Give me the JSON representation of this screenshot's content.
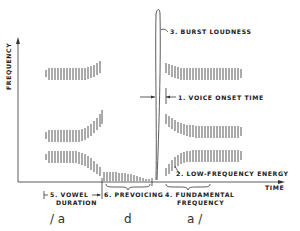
{
  "diagram": {
    "axes": {
      "y_label": "FREQUENCY",
      "x_label": "TIME"
    },
    "annotations": [
      {
        "id": "burst",
        "label": "3. BURST LOUDNESS"
      },
      {
        "id": "vot",
        "label": "1. VOICE ONSET TIME"
      },
      {
        "id": "lfe",
        "label": "2. LOW-FREQUENCY ENERGY"
      },
      {
        "id": "vowel_dur_1",
        "label": "5. VOWEL"
      },
      {
        "id": "vowel_dur_2",
        "label": "DURATION"
      },
      {
        "id": "prevoicing",
        "label": "6. PREVOICING"
      },
      {
        "id": "f0_1",
        "label": "4. FUNDAMENTAL"
      },
      {
        "id": "f0_2",
        "label": "FREQUENCY"
      }
    ],
    "phonemes": [
      "/ a",
      "d",
      "a /"
    ],
    "colors": {
      "ink": "#333333",
      "background": "#ffffff"
    }
  }
}
